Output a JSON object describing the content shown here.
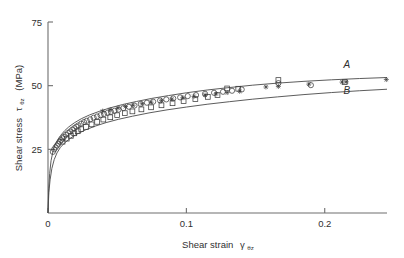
{
  "chart_data": {
    "type": "scatter",
    "title": "",
    "xlabel": "Shear strain",
    "xlabel_symbol": "γ",
    "xlabel_symbol_sub": "θz",
    "ylabel": "Shear stress",
    "ylabel_symbol": "τ",
    "ylabel_symbol_sub": "θz",
    "ylabel_units": "(MPa)",
    "xlim": [
      0,
      0.245
    ],
    "ylim": [
      0,
      75
    ],
    "xticks": [
      0,
      0.1,
      0.2
    ],
    "xticklabels": [
      "0",
      "0.1",
      "0.2"
    ],
    "yticks": [
      25,
      50,
      75
    ],
    "yticklabels": [
      "25",
      "50",
      "75"
    ],
    "grid": false,
    "legend": "inline-curve-labels",
    "curves": [
      {
        "name": "A",
        "label": "A",
        "label_x": 0.216,
        "label_y": 56.8,
        "points_x": [
          0.0,
          0.0005,
          0.0012,
          0.0022,
          0.0035,
          0.005,
          0.007,
          0.009,
          0.012,
          0.015,
          0.019,
          0.024,
          0.03,
          0.037,
          0.045,
          0.054,
          0.064,
          0.075,
          0.087,
          0.1,
          0.115,
          0.13,
          0.148,
          0.166,
          0.185,
          0.205,
          0.225,
          0.245
        ],
        "points_y": [
          0.0,
          9.5,
          15.5,
          20.5,
          24.0,
          26.6,
          28.8,
          30.4,
          32.3,
          33.8,
          35.4,
          37.0,
          38.5,
          39.9,
          41.3,
          42.6,
          43.8,
          45.0,
          46.1,
          47.2,
          48.3,
          49.2,
          50.2,
          51.0,
          51.7,
          52.3,
          52.8,
          53.2
        ]
      },
      {
        "name": "B",
        "label": "B",
        "label_x": 0.216,
        "label_y": 46.6,
        "points_x": [
          0.0,
          0.0006,
          0.0015,
          0.0028,
          0.0045,
          0.0065,
          0.009,
          0.012,
          0.016,
          0.021,
          0.027,
          0.034,
          0.042,
          0.051,
          0.061,
          0.073,
          0.086,
          0.1,
          0.115,
          0.131,
          0.148,
          0.166,
          0.185,
          0.205,
          0.225,
          0.245
        ],
        "points_y": [
          0.0,
          8.0,
          13.0,
          17.5,
          21.0,
          23.6,
          25.8,
          27.5,
          29.3,
          31.0,
          32.6,
          34.1,
          35.5,
          36.8,
          38.0,
          39.3,
          40.5,
          41.6,
          42.7,
          43.7,
          44.7,
          45.6,
          46.5,
          47.3,
          48.0,
          48.6
        ]
      }
    ],
    "series": [
      {
        "name": "circle-series",
        "marker": "open-circle",
        "x": [
          0.0035,
          0.0045,
          0.0055,
          0.0065,
          0.0075,
          0.0085,
          0.0095,
          0.0105,
          0.0115,
          0.013,
          0.0145,
          0.016,
          0.0175,
          0.019,
          0.0205,
          0.022,
          0.024,
          0.026,
          0.028,
          0.0305,
          0.033,
          0.0355,
          0.038,
          0.0405,
          0.043,
          0.0455,
          0.048,
          0.051,
          0.0545,
          0.0585,
          0.0625,
          0.067,
          0.0715,
          0.076,
          0.081,
          0.0855,
          0.0905,
          0.0955,
          0.101,
          0.107,
          0.1135,
          0.12,
          0.1265,
          0.133,
          0.14,
          0.1665,
          0.19
        ],
        "y": [
          24.0,
          25.0,
          25.8,
          26.5,
          27.2,
          28.0,
          28.6,
          29.3,
          29.9,
          30.7,
          31.4,
          32.0,
          32.7,
          33.3,
          33.9,
          34.4,
          35.1,
          35.7,
          36.2,
          36.8,
          37.4,
          37.9,
          38.4,
          38.9,
          39.3,
          39.7,
          40.1,
          40.6,
          41.2,
          41.7,
          42.2,
          42.8,
          43.3,
          43.7,
          44.2,
          44.6,
          45.0,
          45.4,
          45.9,
          46.3,
          46.8,
          47.2,
          47.6,
          48.0,
          48.5,
          51.0,
          50.2
        ]
      },
      {
        "name": "square-series",
        "marker": "open-square",
        "x": [
          0.0105,
          0.0135,
          0.0165,
          0.019,
          0.0215,
          0.024,
          0.0275,
          0.0315,
          0.0355,
          0.04,
          0.045,
          0.05,
          0.0555,
          0.061,
          0.0675,
          0.0745,
          0.082,
          0.09,
          0.098,
          0.1065,
          0.1155,
          0.1225,
          0.1295,
          0.1375,
          0.1665,
          0.2145
        ],
        "y": [
          28.0,
          29.2,
          30.3,
          31.3,
          32.1,
          32.9,
          33.8,
          34.8,
          35.8,
          36.7,
          37.6,
          38.4,
          39.2,
          39.9,
          40.7,
          41.5,
          42.3,
          43.1,
          43.9,
          44.7,
          45.6,
          46.3,
          48.9,
          48.8,
          52.2,
          51.4
        ]
      },
      {
        "name": "star-series",
        "marker": "star-cross",
        "x": [
          0.0395,
          0.045,
          0.0505,
          0.056,
          0.0615,
          0.068,
          0.0745,
          0.082,
          0.0895,
          0.0975,
          0.1055,
          0.1135,
          0.1215,
          0.1295,
          0.1385,
          0.1575,
          0.1665,
          0.1885,
          0.2125,
          0.2155,
          0.2445
        ],
        "y": [
          40.0,
          40.6,
          41.2,
          41.8,
          42.3,
          42.9,
          43.5,
          44.1,
          44.7,
          45.3,
          45.8,
          46.3,
          46.8,
          47.3,
          47.8,
          49.5,
          49.7,
          50.6,
          51.4,
          51.5,
          52.4
        ]
      }
    ]
  },
  "axes": {
    "y_title_main": "Shear stress",
    "y_title_units": "(MPa)",
    "x_title_main": "Shear strain",
    "tick_x": [
      "0",
      "0.1",
      "0.2"
    ],
    "tick_y": [
      "25",
      "50",
      "75"
    ]
  },
  "colors": {
    "background": "#ffffff",
    "axis": "#6e6e6e",
    "curve": "#4a4a4a",
    "marker": "#3c3c3c",
    "text": "#303030"
  }
}
